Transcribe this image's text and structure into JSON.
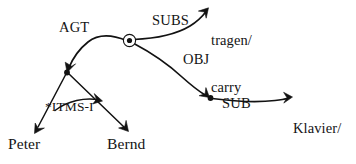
{
  "diagram": {
    "type": "semantic-network",
    "background_color": "#ffffff",
    "stroke_color": "#121212",
    "text_color": "#141414",
    "nodes": [
      {
        "id": "event",
        "kind": "circle-node",
        "label": "",
        "x": 129,
        "y": 40
      },
      {
        "id": "agent",
        "kind": "dot-node",
        "label": "",
        "x": 67,
        "y": 72
      },
      {
        "id": "object",
        "kind": "dot-node",
        "label": "",
        "x": 210,
        "y": 98
      },
      {
        "id": "tragen",
        "kind": "text-node",
        "label": "tragen/\ncarry",
        "x": 211,
        "y": 2
      },
      {
        "id": "klavier",
        "kind": "text-node",
        "label": "Klavier/\npiano",
        "x": 293,
        "y": 90
      },
      {
        "id": "peter",
        "kind": "text-node",
        "label": "Peter",
        "x": 8,
        "y": 136
      },
      {
        "id": "bernd",
        "kind": "text-node",
        "label": "Bernd",
        "x": 107,
        "y": 136
      }
    ],
    "edges": [
      {
        "id": "agt",
        "label": "AGT",
        "from": "event",
        "to": "agent",
        "label_x": 59,
        "label_y": 20
      },
      {
        "id": "subs",
        "label": "SUBS",
        "from": "event",
        "to": "tragen",
        "label_x": 152,
        "label_y": 13
      },
      {
        "id": "obj",
        "label": "OBJ",
        "from": "event",
        "to": "object",
        "label_x": 183,
        "label_y": 52
      },
      {
        "id": "sub",
        "label": "SUB",
        "from": "object",
        "to": "klavier",
        "label_x": 222,
        "label_y": 96
      },
      {
        "id": "itms",
        "label": "*ITMS-I",
        "from": "peter-branch",
        "to": "bernd-branch",
        "label_x": 45,
        "label_y": 100
      },
      {
        "id": "to-peter",
        "label": "",
        "from": "agent",
        "to": "peter",
        "label_x": 0,
        "label_y": 0
      },
      {
        "id": "to-bernd",
        "label": "",
        "from": "agent",
        "to": "bernd",
        "label_x": 0,
        "label_y": 0
      }
    ],
    "labels": {
      "agt": "AGT",
      "subs": "SUBS",
      "obj": "OBJ",
      "sub": "SUB",
      "itms": "*ITMS-I",
      "tragen_line1": "tragen/",
      "tragen_line2": "carry",
      "klavier_line1": "Klavier/",
      "klavier_line2": "piano",
      "peter": "Peter",
      "bernd": "Bernd"
    }
  }
}
